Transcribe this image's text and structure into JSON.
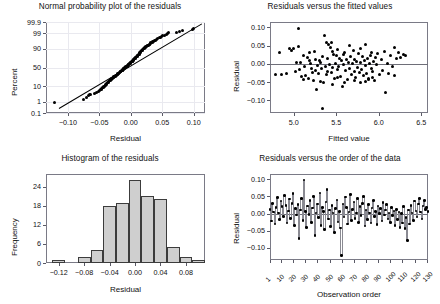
{
  "figure": {
    "layout": "2x2",
    "background": "#ffffff",
    "point_color": "#000000",
    "bar_fill": "#cfcfcf",
    "bar_edge": "#3c3c3c",
    "frame_color": "#7a7a86",
    "grid_color": "#e9e9ef"
  },
  "chart_data": [
    {
      "type": "scatter",
      "id": "normal-probability-plot",
      "title": "Normal probability plot of the residuals",
      "xlabel": "Residual",
      "ylabel": "Percent",
      "xticks": [
        "-0.10",
        "-0.05",
        "0.00",
        "0.05",
        "0.10"
      ],
      "xtickvalues": [
        -0.1,
        -0.05,
        0.0,
        0.05,
        0.1
      ],
      "yticks": [
        "99.9",
        "99",
        "90",
        "50",
        "10",
        "1",
        "0.1"
      ],
      "ytickvalues": [
        99.9,
        99,
        90,
        50,
        10,
        1,
        0.1
      ],
      "yscale": "normal-probability",
      "xlim": [
        -0.135,
        0.118
      ],
      "grid": true,
      "reference_line": true,
      "x": [
        -0.122,
        -0.075,
        -0.071,
        -0.068,
        -0.066,
        -0.064,
        -0.058,
        -0.055,
        -0.052,
        -0.05,
        -0.048,
        -0.047,
        -0.046,
        -0.045,
        -0.044,
        -0.043,
        -0.042,
        -0.041,
        -0.04,
        -0.039,
        -0.038,
        -0.037,
        -0.036,
        -0.035,
        -0.034,
        -0.033,
        -0.032,
        -0.031,
        -0.03,
        -0.029,
        -0.028,
        -0.028,
        -0.027,
        -0.026,
        -0.025,
        -0.024,
        -0.023,
        -0.022,
        -0.021,
        -0.021,
        -0.02,
        -0.019,
        -0.018,
        -0.018,
        -0.017,
        -0.016,
        -0.016,
        -0.015,
        -0.014,
        -0.014,
        -0.013,
        -0.012,
        -0.012,
        -0.011,
        -0.01,
        -0.01,
        -0.009,
        -0.008,
        -0.008,
        -0.007,
        -0.006,
        -0.006,
        -0.005,
        -0.004,
        -0.004,
        -0.003,
        -0.002,
        -0.002,
        -0.001,
        0.0,
        0.0,
        0.001,
        0.002,
        0.002,
        0.003,
        0.004,
        0.004,
        0.005,
        0.006,
        0.006,
        0.007,
        0.008,
        0.008,
        0.009,
        0.01,
        0.01,
        0.011,
        0.012,
        0.013,
        0.014,
        0.014,
        0.015,
        0.016,
        0.017,
        0.018,
        0.019,
        0.02,
        0.021,
        0.022,
        0.023,
        0.024,
        0.025,
        0.026,
        0.027,
        0.028,
        0.029,
        0.03,
        0.031,
        0.032,
        0.034,
        0.035,
        0.036,
        0.038,
        0.039,
        0.041,
        0.043,
        0.045,
        0.047,
        0.049,
        0.051,
        0.054,
        0.056,
        0.058,
        0.06,
        0.073,
        0.078,
        0.082,
        0.098,
        0.1
      ],
      "percent": [
        0.8,
        1.4,
        2.2,
        2.9,
        3.1,
        3.4,
        4.0,
        4.6,
        5.2,
        5.8,
        6.4,
        7.0,
        7.6,
        8.2,
        8.8,
        9.4,
        10.0,
        11.0,
        12.0,
        13.0,
        14.0,
        15.0,
        16.0,
        17.0,
        18.0,
        19.0,
        20.0,
        21.0,
        22.0,
        23.0,
        24.0,
        25.0,
        26.0,
        27.0,
        28.0,
        29.0,
        30.0,
        31.0,
        32.0,
        33.0,
        34.0,
        35.0,
        36.0,
        37.0,
        38.0,
        39.0,
        40.0,
        41.0,
        42.0,
        43.0,
        44.0,
        45.0,
        46.0,
        47.0,
        48.0,
        49.0,
        50.0,
        51.0,
        52.0,
        53.0,
        54.0,
        55.0,
        56.0,
        57.0,
        58.0,
        59.0,
        60.0,
        61.0,
        62.0,
        63.0,
        64.0,
        65.0,
        66.0,
        67.0,
        68.0,
        69.0,
        70.0,
        71.0,
        72.0,
        73.0,
        74.0,
        75.0,
        76.0,
        77.0,
        78.0,
        79.0,
        80.0,
        81.0,
        82.0,
        83.0,
        84.0,
        85.0,
        86.0,
        87.0,
        88.0,
        89.0,
        90.0,
        90.5,
        91.0,
        91.5,
        92.0,
        92.4,
        92.8,
        93.2,
        93.6,
        94.0,
        94.4,
        94.8,
        95.2,
        95.6,
        96.0,
        96.3,
        96.6,
        96.9,
        97.2,
        97.5,
        97.8,
        98.0,
        98.2,
        98.4,
        98.6,
        98.8,
        99.0,
        99.1,
        99.2,
        99.3,
        99.4,
        99.5,
        99.6
      ]
    },
    {
      "type": "scatter",
      "id": "residuals-vs-fits",
      "title": "Residuals versus the fitted values",
      "xlabel": "Fitted value",
      "ylabel": "Residual",
      "xticks": [
        "5.0",
        "5.5",
        "6.0",
        "6.5"
      ],
      "xtickvalues": [
        5.0,
        5.5,
        6.0,
        6.5
      ],
      "yticks": [
        "0.10",
        "0.05",
        "0.00",
        "-0.05",
        "-0.10"
      ],
      "ytickvalues": [
        0.1,
        0.05,
        0.0,
        -0.05,
        -0.1
      ],
      "xlim": [
        4.72,
        6.58
      ],
      "ylim": [
        -0.135,
        0.115
      ],
      "zero_line": true,
      "points": [
        [
          4.79,
          -0.03
        ],
        [
          4.83,
          0.03
        ],
        [
          4.86,
          -0.029
        ],
        [
          4.92,
          -0.027
        ],
        [
          4.95,
          0.041
        ],
        [
          4.97,
          0.038
        ],
        [
          5.0,
          0.043
        ],
        [
          5.02,
          -0.021
        ],
        [
          5.03,
          0.004
        ],
        [
          5.05,
          0.098
        ],
        [
          5.06,
          0.047
        ],
        [
          5.08,
          0.003
        ],
        [
          5.09,
          -0.035
        ],
        [
          5.11,
          0.024
        ],
        [
          5.13,
          -0.006
        ],
        [
          5.14,
          -0.032
        ],
        [
          5.16,
          0.018
        ],
        [
          5.17,
          -0.039
        ],
        [
          5.19,
          0.03
        ],
        [
          5.2,
          0.002
        ],
        [
          5.21,
          -0.012
        ],
        [
          5.23,
          -0.046
        ],
        [
          5.24,
          0.035
        ],
        [
          5.25,
          -0.018
        ],
        [
          5.26,
          0.012
        ],
        [
          5.27,
          -0.071
        ],
        [
          5.28,
          -0.004
        ],
        [
          5.29,
          -0.027
        ],
        [
          5.3,
          0.009
        ],
        [
          5.31,
          -0.048
        ],
        [
          5.32,
          0.005
        ],
        [
          5.33,
          -0.014
        ],
        [
          5.34,
          0.021
        ],
        [
          5.34,
          -0.122
        ],
        [
          5.35,
          -0.052
        ],
        [
          5.36,
          0.077
        ],
        [
          5.37,
          -0.008
        ],
        [
          5.38,
          0.06
        ],
        [
          5.39,
          -0.03
        ],
        [
          5.4,
          0.016
        ],
        [
          5.41,
          0.052
        ],
        [
          5.42,
          -0.002
        ],
        [
          5.43,
          0.046
        ],
        [
          5.44,
          -0.024
        ],
        [
          5.45,
          0.033
        ],
        [
          5.46,
          -0.01
        ],
        [
          5.47,
          0.027
        ],
        [
          5.48,
          -0.041
        ],
        [
          5.49,
          0.001
        ],
        [
          5.5,
          0.022
        ],
        [
          5.51,
          -0.016
        ],
        [
          5.52,
          0.039
        ],
        [
          5.53,
          -0.006
        ],
        [
          5.54,
          0.014
        ],
        [
          5.55,
          -0.034
        ],
        [
          5.56,
          0.008
        ],
        [
          5.57,
          -0.061
        ],
        [
          5.58,
          0.025
        ],
        [
          5.59,
          -0.002
        ],
        [
          5.6,
          0.031
        ],
        [
          5.61,
          -0.019
        ],
        [
          5.62,
          0.011
        ],
        [
          5.63,
          -0.044
        ],
        [
          5.64,
          0.005
        ],
        [
          5.65,
          0.05
        ],
        [
          5.66,
          -0.012
        ],
        [
          5.67,
          0.019
        ],
        [
          5.68,
          -0.028
        ],
        [
          5.69,
          0.0
        ],
        [
          5.7,
          0.036
        ],
        [
          5.71,
          -0.021
        ],
        [
          5.72,
          0.013
        ],
        [
          5.73,
          -0.037
        ],
        [
          5.74,
          0.007
        ],
        [
          5.75,
          -0.009
        ],
        [
          5.76,
          0.028
        ],
        [
          5.77,
          -0.024
        ],
        [
          5.78,
          0.003
        ],
        [
          5.79,
          0.042
        ],
        [
          5.8,
          -0.016
        ],
        [
          5.81,
          0.02
        ],
        [
          5.82,
          -0.032
        ],
        [
          5.83,
          0.009
        ],
        [
          5.84,
          -0.005
        ],
        [
          5.85,
          0.052
        ],
        [
          5.86,
          -0.026
        ],
        [
          5.87,
          0.015
        ],
        [
          5.88,
          -0.04
        ],
        [
          5.89,
          0.001
        ],
        [
          5.9,
          0.024
        ],
        [
          5.91,
          -0.013
        ],
        [
          5.92,
          0.032
        ],
        [
          5.93,
          -0.021
        ],
        [
          5.94,
          0.006
        ],
        [
          5.95,
          -0.045
        ],
        [
          5.96,
          0.017
        ],
        [
          5.97,
          -0.003
        ],
        [
          5.99,
          0.028
        ],
        [
          6.01,
          -0.03
        ],
        [
          6.03,
          0.011
        ],
        [
          6.05,
          -0.017
        ],
        [
          6.07,
          0.035
        ],
        [
          6.08,
          -0.078
        ],
        [
          6.1,
          0.002
        ],
        [
          6.12,
          -0.026
        ],
        [
          6.14,
          0.022
        ],
        [
          6.16,
          -0.008
        ],
        [
          6.18,
          0.044
        ],
        [
          6.19,
          -0.033
        ],
        [
          6.21,
          0.014
        ],
        [
          6.23,
          0.03
        ],
        [
          6.26,
          0.018
        ],
        [
          6.29,
          0.026
        ],
        [
          6.31,
          0.023
        ],
        [
          5.07,
          -0.015
        ],
        [
          5.12,
          -0.043
        ],
        [
          5.18,
          0.008
        ],
        [
          5.22,
          -0.023
        ],
        [
          5.45,
          -0.057
        ],
        [
          5.52,
          -0.037
        ],
        [
          5.6,
          -0.05
        ],
        [
          5.71,
          -0.047
        ],
        [
          5.78,
          -0.051
        ],
        [
          5.84,
          -0.049
        ],
        [
          5.88,
          -0.044
        ],
        [
          5.93,
          -0.038
        ],
        [
          5.4,
          -0.02
        ],
        [
          5.44,
          0.058
        ]
      ]
    },
    {
      "type": "bar",
      "id": "histogram-of-residuals",
      "title": "Histogram of the residuals",
      "xlabel": "Residual",
      "ylabel": "Frequency",
      "xticks": [
        "-0.12",
        "-0.08",
        "-0.04",
        "0.00",
        "0.04",
        "0.08"
      ],
      "xtickvalues": [
        -0.12,
        -0.08,
        -0.04,
        0.0,
        0.04,
        0.08
      ],
      "yticks": [
        "0",
        "6",
        "12",
        "18",
        "24"
      ],
      "ytickvalues": [
        0,
        6,
        12,
        18,
        24
      ],
      "ylim": [
        0,
        28
      ],
      "xlim": [
        -0.14,
        0.11
      ],
      "bin_width": 0.02,
      "bin_starts": [
        -0.13,
        -0.09,
        -0.07,
        -0.05,
        -0.03,
        -0.01,
        0.01,
        0.03,
        0.05,
        0.07,
        0.09
      ],
      "categories": [
        "-0.12",
        "-0.08",
        "-0.06",
        "-0.04",
        "-0.02",
        "0.00",
        "0.02",
        "0.04",
        "0.06",
        "0.08",
        "0.10"
      ],
      "values": [
        1,
        2,
        4,
        18,
        19,
        26,
        21,
        20,
        5,
        2,
        1
      ]
    },
    {
      "type": "line",
      "id": "residuals-vs-order",
      "title": "Residuals versus the order of the data",
      "xlabel": "Observation order",
      "ylabel": "Residual",
      "xticks": [
        "1",
        "10",
        "20",
        "30",
        "40",
        "50",
        "60",
        "70",
        "80",
        "90",
        "100",
        "110",
        "120",
        "130"
      ],
      "xtickvalues": [
        1,
        10,
        20,
        30,
        40,
        50,
        60,
        70,
        80,
        90,
        100,
        110,
        120,
        130
      ],
      "yticks": [
        "0.10",
        "0.05",
        "0.00",
        "-0.05",
        "-0.10"
      ],
      "ytickvalues": [
        0.1,
        0.05,
        0.0,
        -0.05,
        -0.1
      ],
      "xlim": [
        1,
        131
      ],
      "ylim": [
        -0.135,
        0.115
      ],
      "zero_line": true,
      "connected": true,
      "values": [
        0.012,
        -0.022,
        0.03,
        0.004,
        -0.03,
        0.018,
        0.046,
        0.002,
        -0.018,
        0.036,
        0.02,
        -0.008,
        0.052,
        0.024,
        -0.028,
        0.008,
        0.042,
        -0.014,
        0.03,
        0.058,
        -0.035,
        0.014,
        -0.004,
        0.026,
        -0.072,
        0.01,
        0.044,
        -0.02,
        0.098,
        0.006,
        -0.04,
        0.022,
        -0.002,
        0.038,
        -0.026,
        0.016,
        0.05,
        -0.064,
        0.002,
        0.028,
        -0.012,
        0.06,
        -0.034,
        0.018,
        0.006,
        -0.046,
        0.034,
        0.07,
        -0.016,
        0.01,
        -0.038,
        0.024,
        0.002,
        -0.055,
        0.014,
        0.04,
        -0.024,
        0.006,
        -0.042,
        -0.122,
        0.028,
        -0.01,
        0.048,
        0.018,
        -0.03,
        0.004,
        0.056,
        -0.02,
        0.012,
        0.034,
        -0.014,
        0.002,
        0.044,
        -0.026,
        0.02,
        -0.006,
        0.03,
        0.05,
        -0.036,
        0.01,
        -0.018,
        0.026,
        0.002,
        -0.028,
        0.016,
        0.038,
        -0.008,
        0.006,
        -0.032,
        0.022,
        0.0,
        0.014,
        -0.022,
        0.032,
        -0.004,
        0.01,
        0.026,
        -0.016,
        0.002,
        -0.026,
        0.018,
        -0.006,
        0.008,
        -0.034,
        0.012,
        -0.018,
        0.004,
        -0.04,
        0.0,
        -0.028,
        0.02,
        -0.044,
        -0.012,
        -0.078,
        0.01,
        -0.03,
        0.024,
        0.002,
        -0.02,
        0.036,
        0.008,
        -0.01,
        0.028,
        0.044,
        0.004,
        -0.016,
        0.022,
        0.038,
        0.012,
        0.018,
        0.006
      ]
    }
  ]
}
